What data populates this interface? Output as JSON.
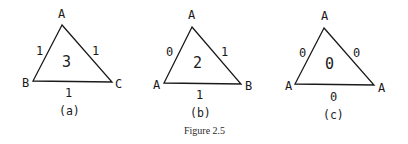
{
  "figure": {
    "caption": "Figure 2.5",
    "triangles": [
      {
        "id": "a",
        "sublabel": "(a)",
        "vertices": {
          "top": "A",
          "left": "B",
          "right": "C"
        },
        "edges": {
          "left": "1",
          "right": "1",
          "bottom": "1"
        },
        "face": "3"
      },
      {
        "id": "b",
        "sublabel": "(b)",
        "vertices": {
          "top": "A",
          "left": "A",
          "right": "B"
        },
        "edges": {
          "left": "0",
          "right": "1",
          "bottom": "1"
        },
        "face": "2"
      },
      {
        "id": "c",
        "sublabel": "(c)",
        "vertices": {
          "top": "A",
          "left": "A",
          "right": "A"
        },
        "edges": {
          "left": "0",
          "right": "0",
          "bottom": "0"
        },
        "face": "0"
      }
    ]
  }
}
